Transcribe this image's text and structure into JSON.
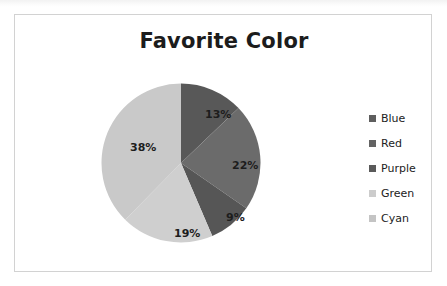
{
  "page": {
    "background_color": "#ffffff",
    "frame_border_color": "#d2d2d2"
  },
  "chart_data": {
    "type": "pie",
    "title": "Favorite Color",
    "xlabel": "",
    "ylabel": "",
    "categories": [
      "Blue",
      "Red",
      "Purple",
      "Green",
      "Cyan"
    ],
    "values": [
      13,
      22,
      9,
      19,
      38
    ],
    "value_labels": [
      "13%",
      "22%",
      "9%",
      "19%",
      "38%"
    ],
    "units": "percent",
    "start_angle_deg": 0,
    "direction": "clockwise",
    "grid": false,
    "legend_position": "right",
    "rendering": "grayscale",
    "slice_colors": [
      "#585858",
      "#6b6b6b",
      "#565656",
      "#cfcfcf",
      "#c9c9c9"
    ],
    "label_text_color": "#1d1d1d"
  },
  "title": {
    "text": "Favorite Color",
    "color": "#1c1c1c"
  },
  "slices": [
    {
      "name": "Blue",
      "label": "13%",
      "value": 13,
      "color": "#585858"
    },
    {
      "name": "Red",
      "label": "22%",
      "value": 22,
      "color": "#6b6b6b"
    },
    {
      "name": "Purple",
      "label": "9%",
      "value": 9,
      "color": "#565656"
    },
    {
      "name": "Green",
      "label": "19%",
      "value": 19,
      "color": "#cfcfcf"
    },
    {
      "name": "Cyan",
      "label": "38%",
      "value": 38,
      "color": "#c9c9c9"
    }
  ],
  "legend": {
    "items": [
      {
        "label": "Blue",
        "swatch_color": "#5e5e5e"
      },
      {
        "label": "Red",
        "swatch_color": "#636363"
      },
      {
        "label": "Purple",
        "swatch_color": "#5a5a5a"
      },
      {
        "label": "Green",
        "swatch_color": "#cccccc"
      },
      {
        "label": "Cyan",
        "swatch_color": "#c4c4c4"
      }
    ]
  }
}
